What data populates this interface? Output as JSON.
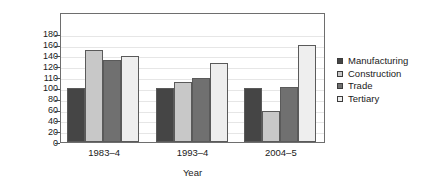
{
  "chart_data": {
    "type": "bar",
    "title": "",
    "xlabel": "Year",
    "ylabel": "Relative productivity",
    "categories": [
      "1983–4",
      "1993–4",
      "2004–5"
    ],
    "series": [
      {
        "name": "Manufacturing",
        "color": "#454545",
        "values": [
          100,
          100,
          100
        ]
      },
      {
        "name": "Construction",
        "color": "#c8c8c8",
        "values": [
          149,
          105,
          57
        ]
      },
      {
        "name": "Trade",
        "color": "#707070",
        "values": [
          131,
          109,
          101
        ]
      },
      {
        "name": "Tertiary",
        "color": "#eeeeee",
        "values": [
          138,
          125,
          160
        ]
      }
    ],
    "ylim": [
      0,
      180
    ],
    "yticks": [
      0,
      20,
      40,
      60,
      80,
      100,
      110,
      120,
      140,
      160,
      180
    ],
    "ytick_labels": [
      "0",
      "20",
      "40",
      "60",
      "80",
      "100",
      "110",
      "120",
      "140",
      "160",
      "180"
    ],
    "grid": false,
    "legend_position": "right"
  },
  "legend": {
    "items": [
      {
        "label": "Manufacturing",
        "swatch": "#454545"
      },
      {
        "label": "Construction",
        "swatch": "#c8c8c8"
      },
      {
        "label": "Trade",
        "swatch": "#707070"
      },
      {
        "label": "Tertiary",
        "swatch": "#eeeeee"
      }
    ]
  }
}
